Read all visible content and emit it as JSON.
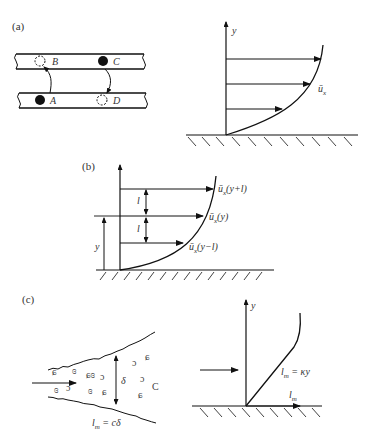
{
  "panels": {
    "a": {
      "label": "(a)",
      "eddy_diagram": {
        "points": [
          {
            "name": "B",
            "state": "dashed-circle",
            "layer": "upper"
          },
          {
            "name": "C",
            "state": "filled-circle",
            "layer": "upper"
          },
          {
            "name": "A",
            "state": "filled-circle",
            "layer": "lower"
          },
          {
            "name": "D",
            "state": "dashed-circle",
            "layer": "lower"
          }
        ],
        "transitions": [
          "A→B",
          "C→D"
        ]
      },
      "profile": {
        "axis_label": "y",
        "curve_label": "ū",
        "curve_label_sub": "x",
        "arrow_count": 3
      }
    },
    "b": {
      "label": "(b)",
      "labels": {
        "top_u": "ū",
        "top_arg": "(y+l)",
        "mid_u": "ū",
        "mid_arg": "(y)",
        "bot_u": "ū",
        "bot_arg": "(y−l)",
        "sub": "x",
        "l_upper": "l",
        "l_lower": "l",
        "y_height": "y"
      }
    },
    "c": {
      "label": "(c)",
      "jet": {
        "width_label": "δ",
        "formula_l": "l",
        "formula_sub": "m",
        "formula_rhs": " = cδ"
      },
      "wall": {
        "axis_label": "y",
        "curve_l": "l",
        "curve_sub": "m",
        "curve_rhs": " = κy",
        "xaxis_l": "l",
        "xaxis_sub": "m"
      }
    }
  }
}
